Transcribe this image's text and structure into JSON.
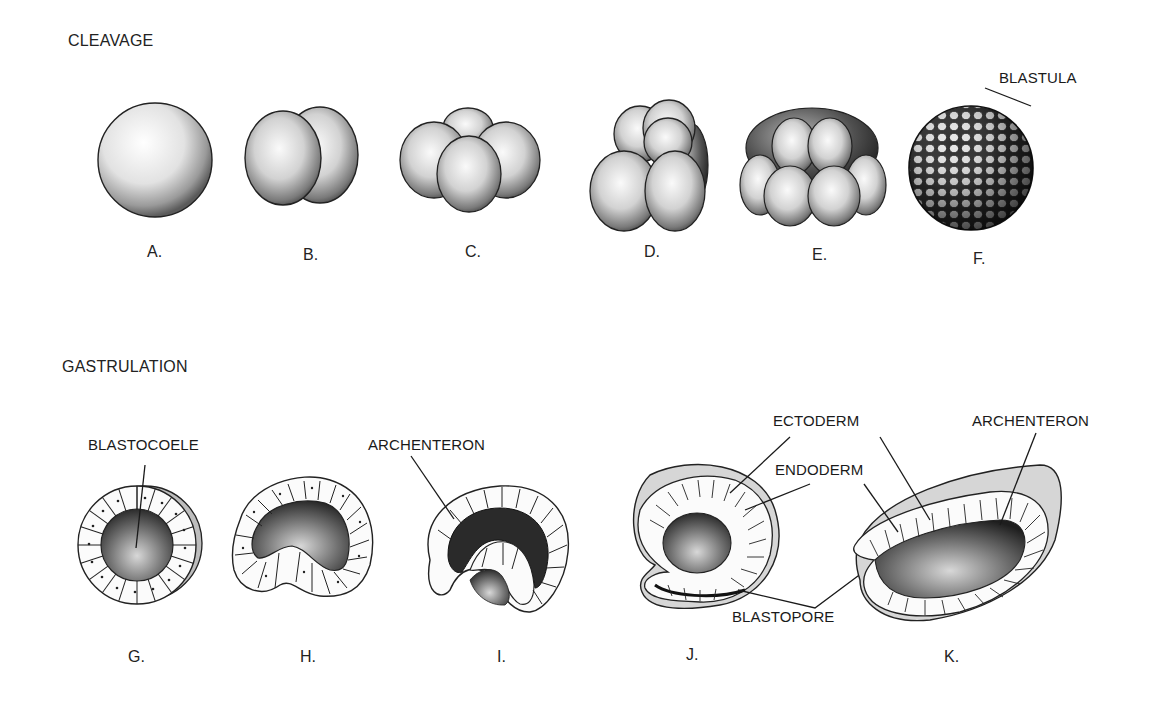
{
  "sections": {
    "cleavage": {
      "title": "CLEAVAGE",
      "figures": [
        {
          "letter": "A.",
          "stage": "zygote (1 cell)"
        },
        {
          "letter": "B.",
          "stage": "2-cell"
        },
        {
          "letter": "C.",
          "stage": "4-cell"
        },
        {
          "letter": "D.",
          "stage": "8-cell"
        },
        {
          "letter": "E.",
          "stage": "16-cell"
        },
        {
          "letter": "F.",
          "stage": "blastula"
        }
      ],
      "callouts": [
        {
          "text": "BLASTULA",
          "target": "F."
        }
      ]
    },
    "gastrulation": {
      "title": "GASTRULATION",
      "figures": [
        {
          "letter": "G.",
          "stage": "blastula cross-section"
        },
        {
          "letter": "H.",
          "stage": "early invagination"
        },
        {
          "letter": "I.",
          "stage": "invagination"
        },
        {
          "letter": "J.",
          "stage": "gastrula"
        },
        {
          "letter": "K.",
          "stage": "late gastrula"
        }
      ],
      "callouts": [
        {
          "text": "BLASTOCOELE",
          "target": "G."
        },
        {
          "text": "ARCHENTERON",
          "target": "I."
        },
        {
          "text": "ECTODERM",
          "target": "J. and K."
        },
        {
          "text": "ENDODERM",
          "target": "J. and K."
        },
        {
          "text": "BLASTOPORE",
          "target": "J. and K."
        },
        {
          "text": "ARCHENTERON",
          "target": "K."
        }
      ]
    }
  },
  "colors": {
    "ink": "#1a1a1a",
    "shade_dark": "#3a3a3a",
    "shade_mid": "#8a8a8a",
    "shade_light": "#d8d8d8",
    "paper": "#ffffff"
  }
}
